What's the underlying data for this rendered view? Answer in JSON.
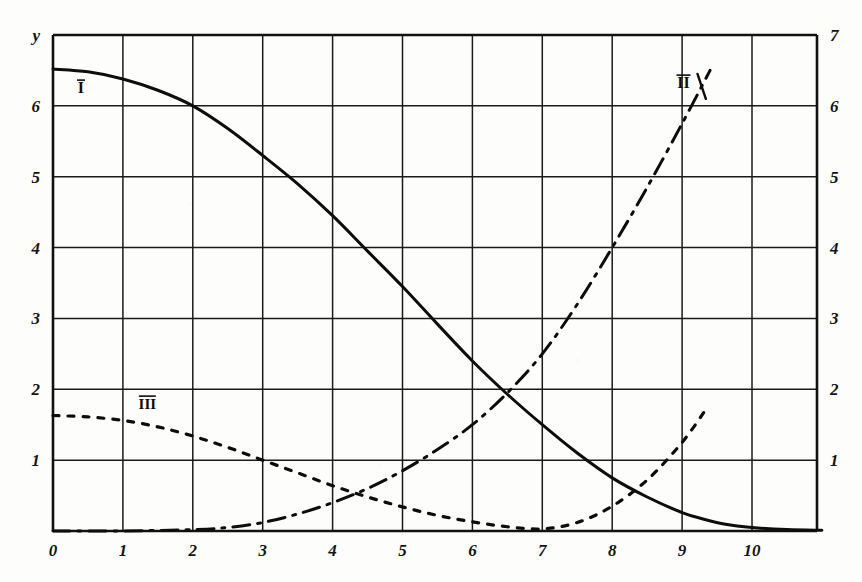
{
  "chart_data": {
    "type": "line",
    "title": "",
    "subtitle": "",
    "xlabel": "",
    "ylabel": "y",
    "xlim": [
      0,
      11.1
    ],
    "ylim": [
      0,
      7
    ],
    "grid": true,
    "grid_x_step": 1,
    "grid_y_step": 1,
    "legend_position": "inline-curve-labels",
    "x_axis": {
      "name": "",
      "ticks": [
        0,
        1,
        2,
        3,
        4,
        5,
        6,
        7,
        8,
        9,
        10
      ],
      "tick_labels": [
        "0",
        "1",
        "2",
        "3",
        "4",
        "5",
        "6",
        "7",
        "8",
        "9",
        "10"
      ]
    },
    "y_axis_left": {
      "name": "y",
      "ticks": [
        1,
        2,
        3,
        4,
        5,
        6
      ],
      "tick_labels": [
        "1",
        "2",
        "3",
        "4",
        "5",
        "6"
      ]
    },
    "y_axis_right": {
      "name": "",
      "ticks": [
        1,
        2,
        3,
        4,
        5,
        6,
        7
      ],
      "tick_labels": [
        "1",
        "2",
        "3",
        "4",
        "5",
        "6",
        "7"
      ]
    },
    "series": [
      {
        "name": "I",
        "label": "I",
        "style": "solid",
        "label_x": 0.4,
        "label_y": 6.18,
        "x": [
          0.0,
          0.5,
          1.0,
          1.5,
          2.0,
          2.5,
          3.0,
          3.5,
          4.0,
          4.5,
          5.0,
          5.5,
          6.0,
          6.5,
          7.0,
          7.5,
          8.0,
          8.5,
          9.0,
          9.3,
          9.6,
          10.0,
          10.5,
          11.0
        ],
        "y": [
          6.52,
          6.48,
          6.38,
          6.22,
          6.0,
          5.68,
          5.3,
          4.9,
          4.45,
          3.95,
          3.45,
          2.92,
          2.4,
          1.93,
          1.5,
          1.1,
          0.75,
          0.48,
          0.26,
          0.17,
          0.1,
          0.05,
          0.02,
          0.01
        ]
      },
      {
        "name": "II",
        "label": "II",
        "style": "dash-dot",
        "label_x": 9.02,
        "label_y": 6.25,
        "x": [
          0.0,
          1.0,
          2.0,
          2.5,
          3.0,
          3.5,
          4.0,
          4.5,
          5.0,
          5.5,
          6.0,
          6.5,
          7.0,
          7.5,
          8.0,
          8.5,
          9.0,
          9.4
        ],
        "y": [
          0.0,
          0.0,
          0.02,
          0.05,
          0.12,
          0.24,
          0.4,
          0.6,
          0.85,
          1.15,
          1.5,
          1.95,
          2.5,
          3.2,
          4.0,
          4.85,
          5.75,
          6.5
        ]
      },
      {
        "name": "III",
        "label": "III",
        "style": "dotted",
        "label_x": 1.35,
        "label_y": 1.72,
        "x": [
          0.0,
          0.5,
          1.0,
          1.5,
          2.0,
          2.5,
          3.0,
          3.5,
          4.0,
          4.5,
          5.0,
          5.5,
          6.0,
          6.5,
          7.0,
          7.5,
          8.0,
          8.5,
          9.0,
          9.35
        ],
        "y": [
          1.63,
          1.61,
          1.56,
          1.47,
          1.34,
          1.18,
          1.0,
          0.82,
          0.64,
          0.48,
          0.34,
          0.22,
          0.13,
          0.06,
          0.03,
          0.12,
          0.35,
          0.72,
          1.25,
          1.73
        ]
      }
    ]
  }
}
